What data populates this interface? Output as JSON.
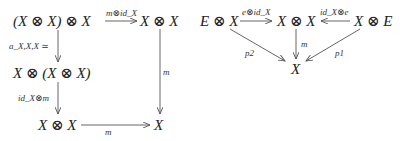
{
  "left_diagram": {
    "title": "associativity square",
    "nodes": {
      "top_left": "(X ⊗ X) ⊗ X",
      "top_right": "X ⊗ X",
      "middle_left": "X ⊗ (X ⊗ X)",
      "bottom_left": "X ⊗ X",
      "bottom_right": "X"
    },
    "arrows": {
      "top": "m⊗id_X",
      "left_upper": "a_X,X,X ≃",
      "left_lower": "id_X⊗m",
      "bottom": "m",
      "right": "m"
    }
  },
  "right_diagram": {
    "title": "unit diagram",
    "nodes": {
      "left": "E ⊗ X",
      "center": "X ⊗ X",
      "right": "X ⊗ E",
      "bottom": "X"
    },
    "arrows": {
      "left_to_center": "e⊗id_X",
      "right_to_center": "id_X⊗e",
      "center_down": "m",
      "left_diag": "p2",
      "right_diag": "p1"
    }
  },
  "colors": {
    "stroke": "#555555",
    "text": "#222222",
    "background": "#ffffff"
  }
}
